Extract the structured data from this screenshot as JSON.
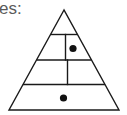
{
  "caption": {
    "text": "es:"
  },
  "diagram": {
    "type": "pyramid",
    "stroke_color": "#1a1a1a",
    "dot_color": "#111111",
    "rows": [
      {
        "index": 1,
        "cells": 1,
        "dots": []
      },
      {
        "index": 2,
        "cells": 2,
        "dots": [
          {
            "cell": 2
          }
        ]
      },
      {
        "index": 3,
        "cells": 2,
        "dots": []
      },
      {
        "index": 4,
        "cells": 1,
        "dots": [
          {
            "cell": 1
          }
        ]
      }
    ]
  }
}
